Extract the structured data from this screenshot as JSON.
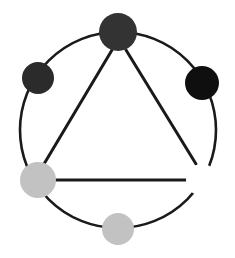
{
  "figure": {
    "background_color": "#ffffff",
    "width": 235,
    "height": 258
  },
  "geometry": {
    "center_x": 118,
    "center_y": 130,
    "circle_radius": 98,
    "edge_color": "#1a1a1a",
    "cycle_edge_width": 2.6,
    "triangle_edge_width": 3.0
  },
  "nodes": [
    {
      "id": "node-top",
      "label": "top",
      "cx": 118,
      "cy": 32,
      "r": 19,
      "fill": "#333333",
      "stroke": "none",
      "angle_deg": 90
    },
    {
      "id": "node-upper-right",
      "label": "upper-right",
      "cx": 202,
      "cy": 83,
      "r": 17,
      "fill": "#0f0f0f",
      "stroke": "none",
      "angle_deg": 30
    },
    {
      "id": "node-lower-right",
      "label": "lower-right",
      "cx": 202,
      "cy": 180,
      "r": 16,
      "fill": "#ffffff",
      "stroke": "none",
      "angle_deg": -30
    },
    {
      "id": "node-bottom",
      "label": "bottom",
      "cx": 118,
      "cy": 229,
      "r": 16,
      "fill": "#c2c2c2",
      "stroke": "none",
      "angle_deg": -90
    },
    {
      "id": "node-lower-left",
      "label": "lower-left",
      "cx": 38,
      "cy": 180,
      "r": 18,
      "fill": "#c2c2c2",
      "stroke": "none",
      "angle_deg": 210
    },
    {
      "id": "node-upper-left",
      "label": "upper-left",
      "cx": 38,
      "cy": 78,
      "r": 16,
      "fill": "#2b2b2b",
      "stroke": "none",
      "angle_deg": 150
    }
  ],
  "cycle_arcs": [
    {
      "id": "arc-top-to-upper-right",
      "from": "node-top",
      "to": "node-upper-right"
    },
    {
      "id": "arc-upper-right-to-lower-right",
      "from": "node-upper-right",
      "to": "node-lower-right"
    },
    {
      "id": "arc-lower-right-to-bottom",
      "from": "node-lower-right",
      "to": "node-bottom"
    },
    {
      "id": "arc-bottom-to-lower-left",
      "from": "node-bottom",
      "to": "node-lower-left"
    },
    {
      "id": "arc-lower-left-to-upper-left",
      "from": "node-lower-left",
      "to": "node-upper-left"
    },
    {
      "id": "arc-upper-left-to-top",
      "from": "node-upper-left",
      "to": "node-top"
    }
  ],
  "triangle_edges": [
    {
      "id": "edge-top-lower-left",
      "from": "node-top",
      "to": "node-lower-left",
      "x1": 112,
      "y1": 50,
      "x2": 44,
      "y2": 164
    },
    {
      "id": "edge-top-lower-right",
      "from": "node-top",
      "to": "node-lower-right",
      "x1": 126,
      "y1": 50,
      "x2": 196,
      "y2": 164
    },
    {
      "id": "edge-lower-left-lower-right",
      "from": "node-lower-left",
      "to": "node-lower-right",
      "x1": 55,
      "y1": 180,
      "x2": 187,
      "y2": 180
    }
  ],
  "chart_data": {
    "type": "diagram",
    "vertex_count": 6,
    "edge_count": 9,
    "vertices": [
      {
        "name": "top",
        "shade": "dark-gray",
        "color": "#333333"
      },
      {
        "name": "upper-right",
        "shade": "black",
        "color": "#0f0f0f"
      },
      {
        "name": "lower-right",
        "shade": "white",
        "color": "#ffffff"
      },
      {
        "name": "bottom",
        "shade": "light-gray",
        "color": "#c2c2c2"
      },
      {
        "name": "lower-left",
        "shade": "light-gray",
        "color": "#c2c2c2"
      },
      {
        "name": "upper-left",
        "shade": "dark-gray",
        "color": "#2b2b2b"
      }
    ],
    "edges": [
      [
        "top",
        "upper-right"
      ],
      [
        "upper-right",
        "lower-right"
      ],
      [
        "lower-right",
        "bottom"
      ],
      [
        "bottom",
        "lower-left"
      ],
      [
        "lower-left",
        "upper-left"
      ],
      [
        "upper-left",
        "top"
      ],
      [
        "top",
        "lower-left"
      ],
      [
        "top",
        "lower-right"
      ],
      [
        "lower-left",
        "lower-right"
      ]
    ]
  }
}
